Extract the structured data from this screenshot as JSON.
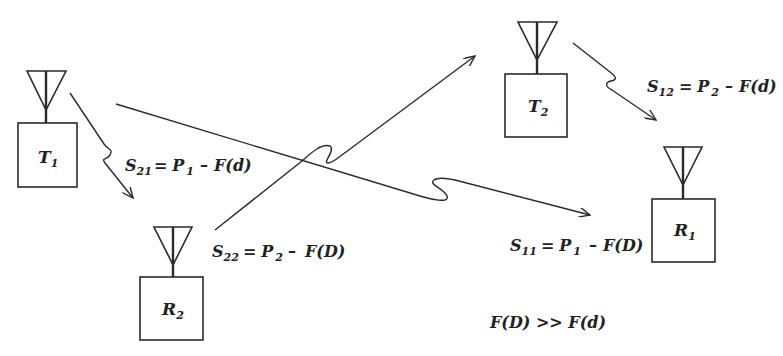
{
  "diagram": {
    "type": "radio interference geometry",
    "stations": [
      {
        "id": "T1",
        "label": "T",
        "sub": "1",
        "role": "transmitter"
      },
      {
        "id": "R2",
        "label": "R",
        "sub": "2",
        "role": "receiver"
      },
      {
        "id": "T2",
        "label": "T",
        "sub": "2",
        "role": "transmitter"
      },
      {
        "id": "R1",
        "label": "R",
        "sub": "1",
        "role": "receiver"
      }
    ],
    "links": [
      {
        "from": "T1",
        "to": "R2",
        "eq": {
          "s": "S",
          "s_sub": "21",
          "p": "P",
          "p_sub": "1",
          "f": "F(d)"
        }
      },
      {
        "from": "R2",
        "to": "T2",
        "eq": {
          "s": "S",
          "s_sub": "22",
          "p": "P",
          "p_sub": "2",
          "f": "F(D)"
        }
      },
      {
        "from": "T2",
        "to": "R1",
        "eq": {
          "s": "S",
          "s_sub": "12",
          "p": "P",
          "p_sub": "2",
          "f": "F(d)"
        }
      },
      {
        "from": "T1",
        "to": "R1",
        "eq": {
          "s": "S",
          "s_sub": "11",
          "p": "P",
          "p_sub": "1",
          "f": "F(D)"
        }
      }
    ],
    "equals": "=",
    "minus": "–",
    "note": "F(D) >> F(d)"
  }
}
